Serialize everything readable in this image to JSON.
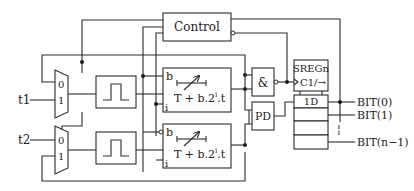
{
  "diagram": {
    "type": "block-diagram",
    "inputs": [
      {
        "id": "t1",
        "label": "t1"
      },
      {
        "id": "t2",
        "label": "t2"
      }
    ],
    "muxes": [
      {
        "id": "mux1",
        "inputs": [
          "0",
          "1"
        ]
      },
      {
        "id": "mux2",
        "inputs": [
          "0",
          "1"
        ]
      }
    ],
    "pulse_blocks": [
      {
        "id": "pulse1",
        "icon": "pulse-icon"
      },
      {
        "id": "pulse2",
        "icon": "pulse-icon"
      }
    ],
    "delay_blocks": [
      {
        "id": "delay1",
        "port_b": "b",
        "port_i": "i",
        "formula_main": "T + b.2",
        "formula_sup": "i",
        "formula_tail": ".t",
        "b_inverted": false
      },
      {
        "id": "delay2",
        "port_b": "b",
        "port_i": "i",
        "formula_main": "T + b.2",
        "formula_sup": "i",
        "formula_tail": ".t",
        "b_inverted": true
      }
    ],
    "control": {
      "label": "Control"
    },
    "and_gate": {
      "label": "&"
    },
    "phase_detector": {
      "label": "PD"
    },
    "shift_register": {
      "title": "SREGn",
      "clock_label": "C1/→",
      "data_label": "1D"
    },
    "outputs": [
      {
        "label": "BIT(0)"
      },
      {
        "label": "BIT(1)"
      },
      {
        "label": "BIT(n−1)"
      }
    ],
    "ellipsis": "¦"
  }
}
